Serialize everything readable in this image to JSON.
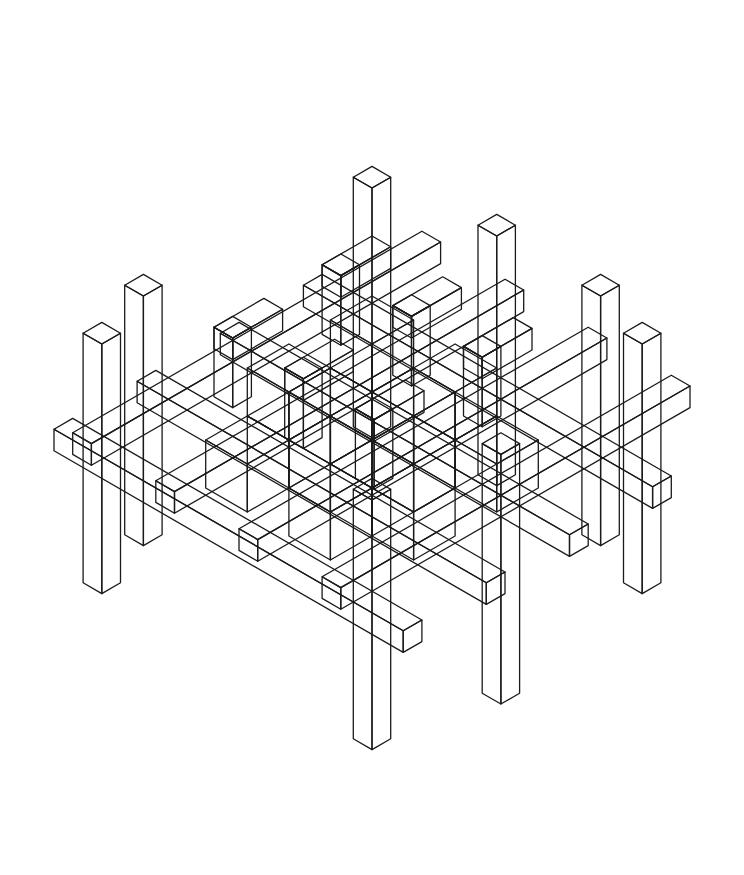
{
  "artwork": {
    "kind": "isometric line-art lattice",
    "stroke_color": "#1a1a1a",
    "background": "#ffffff",
    "unit": 48,
    "center": [
      372,
      440
    ]
  }
}
